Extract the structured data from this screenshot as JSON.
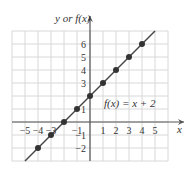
{
  "chart_data": {
    "type": "line",
    "title": "",
    "xlabel": "x",
    "ylabel": "y or f(x)",
    "annotation": "f(x) = x + 2",
    "xlim": [
      -6,
      6
    ],
    "ylim": [
      -3,
      7
    ],
    "grid": true,
    "x_ticks": [
      "−5",
      "−4",
      "−3",
      "−1",
      "1",
      "2",
      "3",
      "4",
      "5"
    ],
    "y_ticks": [
      "6",
      "5",
      "4",
      "3",
      "1",
      "−1",
      "−2"
    ],
    "series": [
      {
        "name": "f(x) = x + 2",
        "points": [
          [
            -4,
            -2
          ],
          [
            -3,
            -1
          ],
          [
            -2,
            0
          ],
          [
            -1,
            1
          ],
          [
            0,
            2
          ],
          [
            1,
            3
          ],
          [
            2,
            4
          ],
          [
            3,
            5
          ],
          [
            4,
            6
          ]
        ]
      }
    ],
    "line_extent": [
      [
        -5.0,
        -3.0
      ],
      [
        5.0,
        7.0
      ]
    ]
  },
  "labels": {
    "xlabel": "x",
    "ylabel": "y or f(x)",
    "annotation": "f(x) = x + 2"
  },
  "colors": {
    "grid": "#d8d8d8",
    "axis": "#555555",
    "line": "#444444",
    "point": "#333333"
  }
}
